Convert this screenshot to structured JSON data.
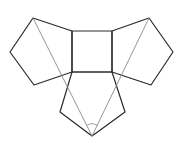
{
  "diagram": {
    "type": "geometric-net",
    "colors": {
      "edge": "#2a2a2a",
      "guide": "#8a8a8a",
      "background": "#ffffff"
    },
    "shapes": {
      "square": {
        "points": "72,31 112,31 112,72 72,72"
      },
      "pentagon_left": {
        "points": "72,31 33,18 10,52 34,85 72,72"
      },
      "pentagon_right": {
        "points": "112,31 149,18 173,52 151,85 112,72"
      },
      "pentagon_bottom": {
        "points": "72,72 60,112 92,136 125,112 112,72"
      }
    },
    "guides": [
      {
        "x1": 33,
        "y1": 18,
        "x2": 92,
        "y2": 136
      },
      {
        "x1": 149,
        "y1": 18,
        "x2": 92,
        "y2": 136
      }
    ],
    "angle_arc": {
      "d": "M 87 125 Q 92 122 97 125"
    }
  }
}
